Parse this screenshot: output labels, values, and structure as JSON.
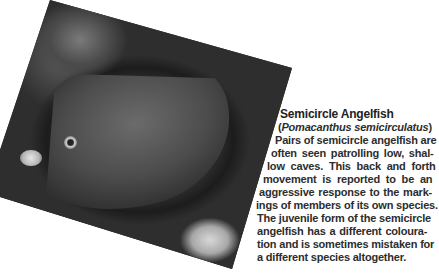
{
  "photo": {
    "subject": "Semicircle angelfish swimming near soft coral",
    "alt": "photo of semicircle angelfish"
  },
  "caption": {
    "title": "Semicircle Angelfish",
    "scientific_name_open": "(",
    "scientific_name": "Pomacanthus semicirculatus",
    "scientific_name_close": ")",
    "lines": [
      "Pairs of semicircle angelfish are",
      "often seen patrolling low, shal-",
      "low caves. This back and forth",
      "movement is reported to be an",
      "aggressive response to the mark-",
      "ings of members of its own species.",
      "The juvenile form of the semicircle",
      "angelfish has a different coloura-",
      "tion and is sometimes mistaken for",
      "a different species altogether."
    ]
  }
}
